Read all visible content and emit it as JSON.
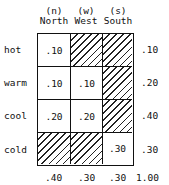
{
  "columns": [
    {
      "code": "(n)",
      "label": "North"
    },
    {
      "code": "(w)",
      "label": "West"
    },
    {
      "code": "(s)",
      "label": "South"
    }
  ],
  "rows": [
    {
      "label": "hot",
      "cells": [
        ".10",
        "",
        ""
      ],
      "hatched": [
        false,
        true,
        true
      ],
      "total": ".10"
    },
    {
      "label": "warm",
      "cells": [
        ".10",
        ".10",
        ""
      ],
      "hatched": [
        false,
        false,
        true
      ],
      "total": ".20"
    },
    {
      "label": "cool",
      "cells": [
        ".20",
        ".20",
        ""
      ],
      "hatched": [
        false,
        false,
        true
      ],
      "total": ".40"
    },
    {
      "label": "cold",
      "cells": [
        "",
        "",
        ".30"
      ],
      "hatched": [
        true,
        true,
        false
      ],
      "total": ".30"
    }
  ],
  "column_totals": [
    ".40",
    ".30",
    ".30"
  ],
  "grand_total": "1.00"
}
